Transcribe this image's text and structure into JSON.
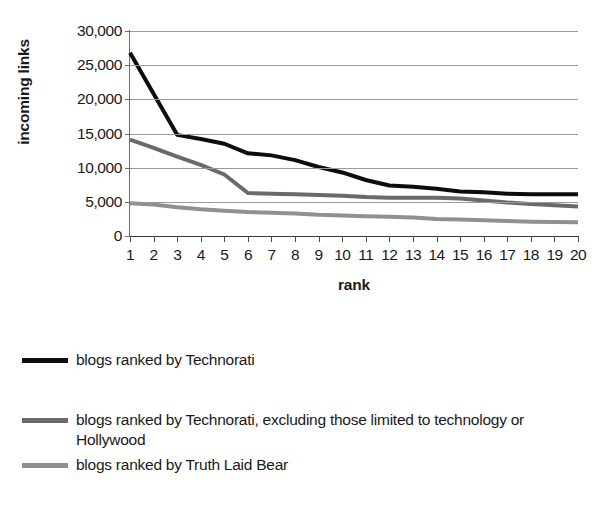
{
  "chart_data": {
    "type": "line",
    "title": "",
    "xlabel": "rank",
    "ylabel": "incoming links",
    "x": [
      1,
      2,
      3,
      4,
      5,
      6,
      7,
      8,
      9,
      10,
      11,
      12,
      13,
      14,
      15,
      16,
      17,
      18,
      19,
      20
    ],
    "categories": [
      "1",
      "2",
      "3",
      "4",
      "5",
      "6",
      "7",
      "8",
      "9",
      "10",
      "11",
      "12",
      "13",
      "14",
      "15",
      "16",
      "17",
      "18",
      "19",
      "20"
    ],
    "xlim": [
      1,
      20
    ],
    "ylim": [
      0,
      30000
    ],
    "y_ticks": [
      0,
      5000,
      10000,
      15000,
      20000,
      25000,
      30000
    ],
    "y_ticklabels": [
      "0",
      "5,000",
      "10,000",
      "15,000",
      "20,000",
      "25,000",
      "30,000"
    ],
    "grid": "horizontal",
    "legend_position": "below",
    "series": [
      {
        "name": "blogs ranked by Technorati",
        "color": "#0d0d0d",
        "width": 4,
        "values": [
          26800,
          20800,
          14800,
          14200,
          13500,
          12100,
          11800,
          11100,
          10100,
          9300,
          8200,
          7400,
          7200,
          6900,
          6500,
          6400,
          6200,
          6100,
          6100,
          6100
        ]
      },
      {
        "name": "blogs ranked by Technorati, excluding those limited to technology or Hollywood",
        "color": "#6a6a6a",
        "width": 4,
        "values": [
          14100,
          12900,
          11600,
          10400,
          9000,
          6300,
          6200,
          6100,
          6000,
          5900,
          5700,
          5600,
          5600,
          5600,
          5500,
          5200,
          4900,
          4700,
          4500,
          4300
        ]
      },
      {
        "name": "blogs ranked by Truth Laid Bear",
        "color": "#909090",
        "width": 4,
        "values": [
          4800,
          4600,
          4200,
          3900,
          3700,
          3500,
          3400,
          3300,
          3100,
          3000,
          2900,
          2800,
          2700,
          2500,
          2400,
          2300,
          2200,
          2100,
          2050,
          2000
        ]
      }
    ]
  },
  "axes": {
    "y_title": "incoming links",
    "x_title": "rank"
  },
  "legend": {
    "entries": [
      {
        "label": "blogs ranked by Technorati",
        "color": "#0d0d0d",
        "thickness": 5
      },
      {
        "label": "blogs ranked by Technorati, excluding those limited to technology or Hollywood",
        "color": "#6a6a6a",
        "thickness": 5
      },
      {
        "label": "blogs ranked by Truth Laid Bear",
        "color": "#909090",
        "thickness": 5
      }
    ]
  }
}
